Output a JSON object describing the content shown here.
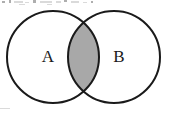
{
  "figure": {
    "kind": "venn-diagram",
    "width": 174,
    "height": 113,
    "background_color": "#ffffff",
    "stroke_color": "#1a1a1a",
    "stroke_width": 2,
    "shaded_region": "intersection",
    "shaded_fill_color": "#a8a8a8",
    "circle_fill_color": "#ffffff"
  },
  "sets": {
    "left": {
      "label": "A",
      "center_x": 53,
      "center_y": 57,
      "radius": 46,
      "label_x": 48,
      "label_y": 58
    },
    "right": {
      "label": "B",
      "center_x": 114,
      "center_y": 57,
      "radius": 46,
      "label_x": 119,
      "label_y": 58
    }
  },
  "intersection": {
    "top_crossing_x": 84,
    "top_crossing_y": 22,
    "bottom_crossing_x": 84,
    "bottom_crossing_y": 91,
    "left_extent_x": 69,
    "right_extent_x": 98
  },
  "artifacts": {
    "note": "faint scan marks along top edge",
    "specks": [
      {
        "x": 2,
        "y": 1,
        "w": 3,
        "h": 2
      },
      {
        "x": 9,
        "y": 0,
        "w": 2,
        "h": 3
      },
      {
        "x": 14,
        "y": 1,
        "w": 9,
        "h": 2
      },
      {
        "x": 25,
        "y": 2,
        "w": 4,
        "h": 1
      },
      {
        "x": 33,
        "y": 0,
        "w": 3,
        "h": 3
      },
      {
        "x": 40,
        "y": 1,
        "w": 12,
        "h": 2
      },
      {
        "x": 56,
        "y": 1,
        "w": 5,
        "h": 2
      },
      {
        "x": 64,
        "y": 0,
        "w": 3,
        "h": 2
      },
      {
        "x": 71,
        "y": 1,
        "w": 8,
        "h": 2
      },
      {
        "x": 83,
        "y": 2,
        "w": 4,
        "h": 1
      },
      {
        "x": 91,
        "y": 1,
        "w": 2,
        "h": 2
      },
      {
        "x": 19,
        "y": 4,
        "w": 6,
        "h": 1
      },
      {
        "x": 47,
        "y": 4,
        "w": 5,
        "h": 1
      },
      {
        "x": 0,
        "y": 108,
        "w": 10,
        "h": 1
      }
    ]
  }
}
